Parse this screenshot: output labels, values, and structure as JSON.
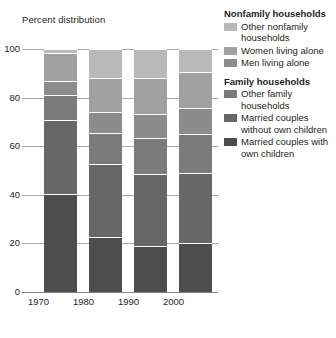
{
  "chart_data": {
    "type": "bar",
    "stacked": true,
    "title": "",
    "axis_note": "Percent distribution",
    "xlabel": "",
    "ylabel": "Percent distribution",
    "ylim": [
      0,
      100
    ],
    "yticks": [
      0,
      20,
      40,
      60,
      80,
      100
    ],
    "grid": true,
    "legend_position": "right",
    "categories": [
      "1970",
      "1980",
      "1990",
      "2000"
    ],
    "series": [
      {
        "name": "Married couples with own children",
        "group": "Family households",
        "color": "#4d4d4d",
        "values": [
          40.3,
          22.6,
          18.9,
          20.2
        ]
      },
      {
        "name": "Married couples without own children",
        "group": "Family households",
        "color": "#676767",
        "values": [
          30.3,
          29.9,
          29.8,
          28.7
        ]
      },
      {
        "name": "Other family households",
        "group": "Family households",
        "color": "#7b7b7b",
        "values": [
          10.6,
          12.9,
          14.8,
          16.0
        ]
      },
      {
        "name": "Men living alone",
        "group": "Nonfamily households",
        "color": "#8c8c8c",
        "values": [
          5.6,
          8.6,
          9.7,
          10.7
        ]
      },
      {
        "name": "Women living alone",
        "group": "Nonfamily households",
        "color": "#a0a0a0",
        "values": [
          11.5,
          14.0,
          14.9,
          14.8
        ]
      },
      {
        "name": "Other nonfamily households",
        "group": "Nonfamily households",
        "color": "#b9b9b9",
        "values": [
          1.7,
          12.0,
          11.9,
          9.6
        ]
      }
    ]
  },
  "legend": {
    "groups": [
      {
        "heading": "Nonfamily households",
        "items": [
          {
            "label": "Other nonfamily households",
            "color": "#b9b9b9"
          },
          {
            "label": "Women living alone",
            "color": "#a0a0a0"
          },
          {
            "label": "Men living alone",
            "color": "#8c8c8c"
          }
        ]
      },
      {
        "heading": "Family households",
        "items": [
          {
            "label": "Other family households",
            "color": "#7b7b7b"
          },
          {
            "label": "Married couples without own children",
            "color": "#676767"
          },
          {
            "label": "Married couples with own children",
            "color": "#4d4d4d"
          }
        ]
      }
    ]
  },
  "colors": {
    "gridline": "#a7a9ac",
    "baseline": "#808285",
    "text": "#231f20",
    "background": "#ffffff"
  }
}
